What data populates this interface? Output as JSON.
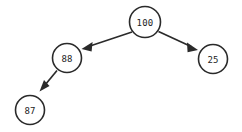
{
  "diagram": {
    "type": "tree",
    "background_color": "#ffffff",
    "stroke_color": "#2a2a2a",
    "node_fill_color": "#ffffff",
    "text_color": "#1d1d1d",
    "nodes": [
      {
        "id": "root",
        "label": "100",
        "cx": 145,
        "cy": 22,
        "r": 15.5,
        "role": "root"
      },
      {
        "id": "left",
        "label": "88",
        "cx": 67,
        "cy": 58,
        "r": 14.5,
        "role": "left-child"
      },
      {
        "id": "right",
        "label": "25",
        "cx": 213,
        "cy": 59,
        "r": 14.5,
        "role": "right-child"
      },
      {
        "id": "left-left",
        "label": "87",
        "cx": 30,
        "cy": 110,
        "r": 14.5,
        "role": "left-left-child"
      }
    ],
    "edges": [
      {
        "id": "root-to-left",
        "from": "root",
        "to": "left",
        "direction": "down-left",
        "arrow": "triangle"
      },
      {
        "id": "root-to-right",
        "from": "root",
        "to": "right",
        "direction": "down-right",
        "arrow": "triangle"
      },
      {
        "id": "left-to-left-left",
        "from": "left",
        "to": "left-left",
        "direction": "down-left",
        "arrow": "triangle"
      }
    ]
  }
}
